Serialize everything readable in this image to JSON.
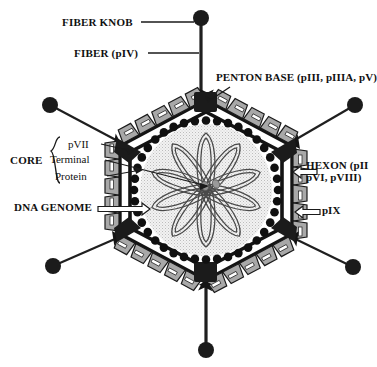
{
  "figure": {
    "background_color": "#ffffff",
    "ink_color": "#1a1a1a"
  },
  "labels": {
    "fiber_knob": "FIBER KNOB",
    "fiber_piv": "FIBER (pIV)",
    "penton_base": "PENTON BASE (pIII, pIIIA, pV)",
    "hexon_line1": "HEXON (pII",
    "hexon_line2": "pVI, pVIII)",
    "pix": "pIX",
    "dna_genome": "DNA GENOME",
    "core": "CORE",
    "core_items": [
      "pVII",
      "Terminal",
      "Protein"
    ]
  },
  "colors": {
    "capsid_outline": "#141414",
    "penton_base_fill": "#1b1b1b",
    "hexon_fill": "#a8a8a8",
    "hexon_stroke": "#1a1a1a",
    "core_dot_fill": "#101010",
    "core_interior_fill": "#e9e9e9",
    "dna_strand_stroke": "#4a4a4a",
    "terminal_protein_fill": "#8d8d8d",
    "fiber_shaft": "#1f1f1f",
    "fiber_knob_fill": "#1b1b1b",
    "leader_line": "#1a1a1a"
  },
  "geometry": {
    "capsid_center": [
      206,
      190
    ],
    "capsid_outer_radius": 106,
    "core_radius": 66,
    "core_dot_count": 40,
    "hexons_per_edge": 5,
    "penton_vertices": 6,
    "dna_loop_count": 10
  },
  "fibers": [
    {
      "name": "fiber-top",
      "knob": [
        201,
        18
      ],
      "vertex": [
        201,
        100
      ],
      "knob_r": 8
    },
    {
      "name": "fiber-upper-left",
      "knob": [
        50,
        105
      ],
      "vertex": [
        129,
        146
      ],
      "knob_r": 8
    },
    {
      "name": "fiber-upper-right",
      "knob": [
        355,
        105
      ],
      "vertex": [
        283,
        146
      ],
      "knob_r": 8
    },
    {
      "name": "fiber-lower-left",
      "knob": [
        53,
        266
      ],
      "vertex": [
        129,
        234
      ],
      "knob_r": 8
    },
    {
      "name": "fiber-lower-right",
      "knob": [
        353,
        267
      ],
      "vertex": [
        283,
        234
      ],
      "knob_r": 8
    },
    {
      "name": "fiber-bottom",
      "knob": [
        206,
        350
      ],
      "vertex": [
        206,
        280
      ],
      "knob_r": 8
    }
  ],
  "leader_lines": [
    {
      "name": "leader-fiber-knob",
      "from": [
        141,
        22
      ],
      "to": [
        193,
        22
      ]
    },
    {
      "name": "leader-fiber-piv",
      "from": [
        148,
        53
      ],
      "to": [
        199,
        53
      ]
    },
    {
      "name": "leader-penton-base",
      "from": [
        228,
        86
      ],
      "to": [
        209,
        100
      ]
    },
    {
      "name": "leader-pvii",
      "from": [
        100,
        144
      ],
      "to": [
        133,
        150
      ]
    },
    {
      "name": "leader-terminal",
      "from": [
        104,
        160
      ],
      "to": [
        208,
        185
      ]
    },
    {
      "name": "leader-protein",
      "from": [
        106,
        176
      ],
      "to": [
        140,
        170
      ]
    }
  ],
  "block_arrows": [
    {
      "name": "arrow-hexon",
      "tip": [
        293,
        172
      ],
      "tail": [
        316,
        172
      ],
      "dir": "left"
    },
    {
      "name": "arrow-pix",
      "tip": [
        295,
        212
      ],
      "tail": [
        320,
        212
      ],
      "dir": "left"
    },
    {
      "name": "arrow-dna-genome",
      "tip": [
        148,
        209
      ],
      "tail": [
        97,
        209
      ],
      "dir": "right"
    }
  ]
}
